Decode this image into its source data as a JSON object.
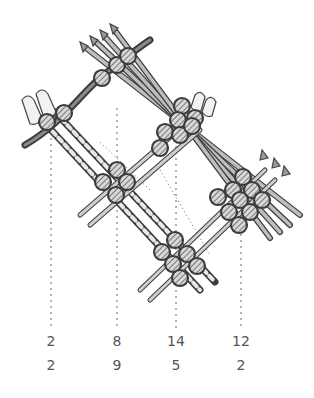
{
  "figure": {
    "ink_color": "#444444",
    "fill_color": "#9a9a9a",
    "columns": [
      {
        "x": 51,
        "top": "2",
        "bottom": "2"
      },
      {
        "x": 117,
        "top": "8",
        "bottom": "9"
      },
      {
        "x": 176,
        "top": "14",
        "bottom": "5"
      },
      {
        "x": 241,
        "top": "12",
        "bottom": "2"
      }
    ]
  }
}
